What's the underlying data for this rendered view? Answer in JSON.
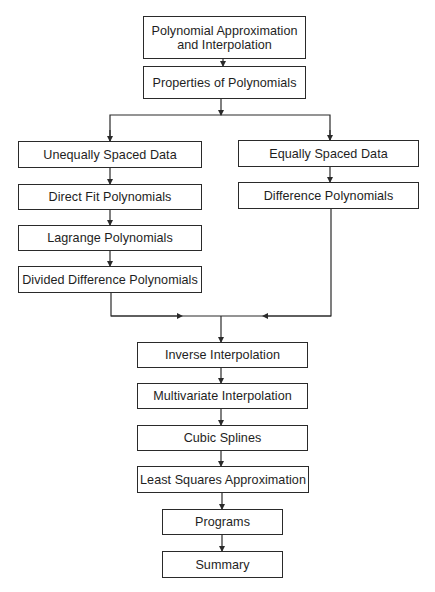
{
  "diagram": {
    "type": "flowchart",
    "nodes": {
      "title": {
        "line1": "Polynomial Approximation",
        "line2": "and Interpolation"
      },
      "properties": {
        "label": "Properties of Polynomials"
      },
      "unequal": {
        "label": "Unequally Spaced Data"
      },
      "direct_fit": {
        "label": "Direct Fit Polynomials"
      },
      "lagrange": {
        "label": "Lagrange Polynomials"
      },
      "divided": {
        "label": "Divided Difference Polynomials"
      },
      "equal": {
        "label": "Equally Spaced Data"
      },
      "difference": {
        "label": "Difference Polynomials"
      },
      "inverse": {
        "label": "Inverse Interpolation"
      },
      "multivariate": {
        "label": "Multivariate Interpolation"
      },
      "cubic": {
        "label": "Cubic Splines"
      },
      "least_squares": {
        "label": "Least Squares Approximation"
      },
      "programs": {
        "label": "Programs"
      },
      "summary": {
        "label": "Summary"
      }
    },
    "edges": [
      [
        "title",
        "properties"
      ],
      [
        "properties",
        "unequal"
      ],
      [
        "properties",
        "equal"
      ],
      [
        "unequal",
        "direct_fit"
      ],
      [
        "direct_fit",
        "lagrange"
      ],
      [
        "lagrange",
        "divided"
      ],
      [
        "equal",
        "difference"
      ],
      [
        "divided",
        "inverse"
      ],
      [
        "difference",
        "inverse"
      ],
      [
        "inverse",
        "multivariate"
      ],
      [
        "multivariate",
        "cubic"
      ],
      [
        "cubic",
        "least_squares"
      ],
      [
        "least_squares",
        "programs"
      ],
      [
        "programs",
        "summary"
      ]
    ],
    "colors": {
      "line": "#2a2a2a",
      "background": "#ffffff",
      "text": "#1e1e1e"
    }
  }
}
